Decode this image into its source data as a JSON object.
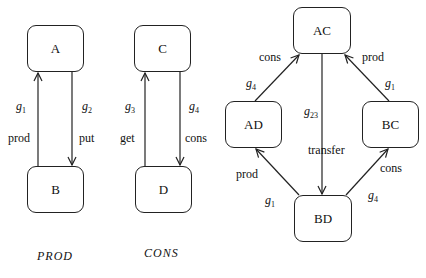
{
  "diagrams": {
    "prod": {
      "caption": "PROD",
      "nodes": {
        "a": "A",
        "b": "B"
      },
      "edges": [
        {
          "from": "B",
          "to": "A",
          "guard": "g",
          "guard_sub": "1",
          "label": "prod"
        },
        {
          "from": "A",
          "to": "B",
          "guard": "g",
          "guard_sub": "2",
          "label": "put"
        }
      ]
    },
    "cons": {
      "caption": "CONS",
      "nodes": {
        "c": "C",
        "d": "D"
      },
      "edges": [
        {
          "from": "D",
          "to": "C",
          "guard": "g",
          "guard_sub": "3",
          "label": "get"
        },
        {
          "from": "C",
          "to": "D",
          "guard": "g",
          "guard_sub": "4",
          "label": "cons"
        }
      ]
    },
    "product": {
      "nodes": {
        "ac": "AC",
        "ad": "AD",
        "bc": "BC",
        "bd": "BD"
      },
      "edges": [
        {
          "from": "AD",
          "to": "AC",
          "guard": "g",
          "guard_sub": "4",
          "label": "cons"
        },
        {
          "from": "BC",
          "to": "AC",
          "guard": "g",
          "guard_sub": "1",
          "label": "prod"
        },
        {
          "from": "AC",
          "to": "BD",
          "guard": "g",
          "guard_sub": "23",
          "label": "transfer"
        },
        {
          "from": "BD",
          "to": "AD",
          "guard": "g",
          "guard_sub": "1",
          "label": "prod"
        },
        {
          "from": "BD",
          "to": "BC",
          "guard": "g",
          "guard_sub": "4",
          "label": "cons"
        }
      ]
    }
  }
}
